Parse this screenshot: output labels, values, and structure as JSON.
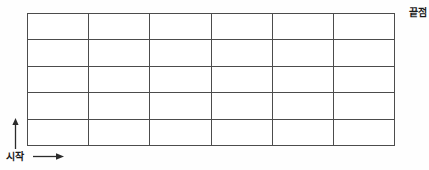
{
  "diagram": {
    "background_color": "#fefefe",
    "line_color": "#4c4c4c",
    "text_color": "#1a1a1a",
    "grid": {
      "columns": 6,
      "rows": 5,
      "x": 27,
      "y": 13,
      "width": 368,
      "height": 133,
      "cell_width": 61.3,
      "cell_height": 26.6,
      "cell_count": 30
    },
    "labels": {
      "end": "끝점",
      "start": "시작"
    },
    "arrows": {
      "up": {
        "name": "up-arrow",
        "direction": "up",
        "x": 15,
        "y_from": 148,
        "y_to": 119
      },
      "right": {
        "name": "right-arrow",
        "direction": "right",
        "y": 157,
        "x_from": 34,
        "x_to": 63
      }
    }
  }
}
